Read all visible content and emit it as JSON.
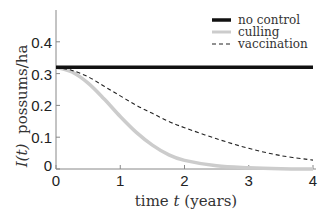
{
  "chart_data": {
    "type": "line",
    "title": "",
    "xlabel": "time t (years)",
    "ylabel": "I(t) possums/ha",
    "xlim": [
      0,
      4
    ],
    "ylim": [
      0,
      0.5
    ],
    "xticks": [
      "0",
      "1",
      "2",
      "3",
      "4"
    ],
    "yticks": [
      "0",
      "0.1",
      "0.2",
      "0.3",
      "0.4"
    ],
    "grid": false,
    "legend_position": "upper right",
    "x": [
      0,
      0.25,
      0.5,
      0.75,
      1.0,
      1.25,
      1.5,
      1.75,
      2.0,
      2.5,
      3.0,
      3.5,
      4.0
    ],
    "series": [
      {
        "name": "no control",
        "style": "solid-black-thick",
        "color": "#111111",
        "values": [
          0.32,
          0.32,
          0.32,
          0.32,
          0.32,
          0.32,
          0.32,
          0.32,
          0.32,
          0.32,
          0.32,
          0.32,
          0.32
        ]
      },
      {
        "name": "culling",
        "style": "solid-lightgray-thick",
        "color": "#cccccc",
        "values": [
          0.32,
          0.305,
          0.27,
          0.22,
          0.165,
          0.115,
          0.075,
          0.045,
          0.027,
          0.01,
          0.004,
          0.001,
          0.0
        ]
      },
      {
        "name": "vaccination",
        "style": "dashed-black-thin",
        "color": "#222222",
        "values": [
          0.32,
          0.31,
          0.29,
          0.26,
          0.23,
          0.2,
          0.175,
          0.15,
          0.13,
          0.095,
          0.065,
          0.042,
          0.028
        ]
      }
    ]
  },
  "labels": {
    "xlabel": "time t (years)",
    "ylabel_math": "I(t)",
    "ylabel_text": "possums/ha",
    "legend": [
      "no control",
      "culling",
      "vaccination"
    ]
  }
}
